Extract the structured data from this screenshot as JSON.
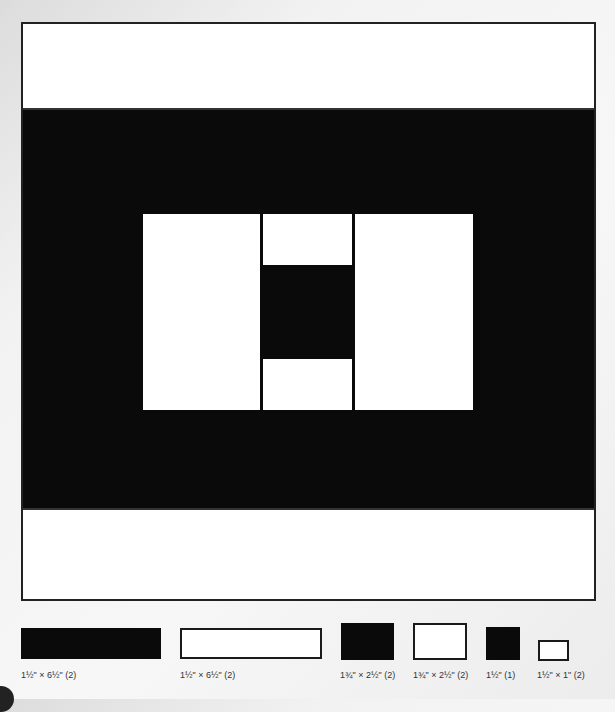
{
  "diagram": {
    "title": "",
    "block": {
      "top_band": {
        "color": "white"
      },
      "middle_band": {
        "color": "black"
      },
      "bottom_band": {
        "color": "white"
      },
      "center_unit": {
        "left_rect": {
          "color": "white"
        },
        "center_column": [
          {
            "color": "white"
          },
          {
            "color": "black"
          },
          {
            "color": "white"
          }
        ],
        "right_rect": {
          "color": "white"
        }
      }
    }
  },
  "legend": {
    "pieces": [
      {
        "color": "black",
        "label": "1½\" × 6½\" (2)"
      },
      {
        "color": "white",
        "label": "1½\" × 6½\" (2)"
      },
      {
        "color": "black",
        "label": "1¾\" × 2½\" (2)"
      },
      {
        "color": "white",
        "label": "1¾\" × 2½\" (2)"
      },
      {
        "color": "black",
        "label": "1½\" (1)"
      },
      {
        "color": "white",
        "label": "1½\" × 1\" (2)"
      }
    ]
  },
  "colors": {
    "dark": "#0a0a0a",
    "light": "#ffffff",
    "outline": "#1a1a1a",
    "background": "#f2f2f2"
  }
}
